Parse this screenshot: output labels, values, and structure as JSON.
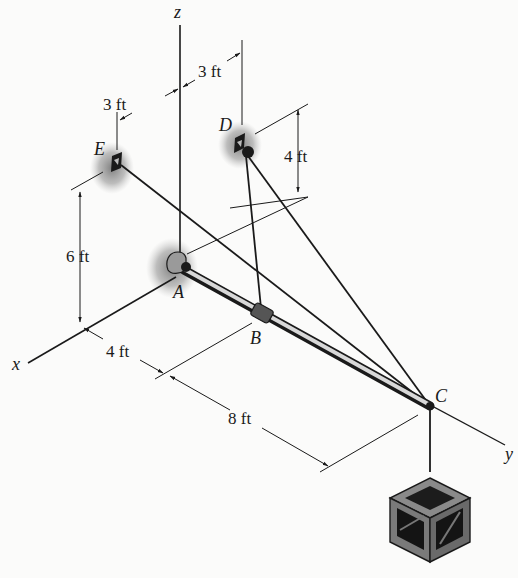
{
  "figure": {
    "type": "3D statics diagram",
    "axes": {
      "x": "x",
      "y": "y",
      "z": "z"
    },
    "points": {
      "A": "A",
      "B": "B",
      "C": "C",
      "D": "D",
      "E": "E"
    },
    "dimensions": {
      "e_offset": "3 ft",
      "d_offset": "3 ft",
      "d_height": "4 ft",
      "e_height": "6 ft",
      "ab_length": "4 ft",
      "bc_length": "8 ft"
    },
    "members": [
      {
        "name": "boom",
        "from": "A",
        "to": "C"
      },
      {
        "name": "cable",
        "from": "B",
        "to": "D"
      },
      {
        "name": "cable",
        "from": "C",
        "to": "D"
      },
      {
        "name": "cable",
        "from": "C",
        "to": "E"
      },
      {
        "name": "cable",
        "from": "C",
        "to": "crate"
      }
    ],
    "supports": [
      "ball-and-socket at A",
      "anchor at D",
      "anchor at E"
    ],
    "load": "crate hanging from C"
  }
}
